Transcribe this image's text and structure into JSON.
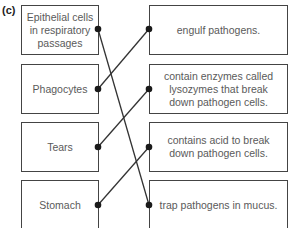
{
  "question_label": "(c)",
  "left_items": [
    {
      "text": "Epithelial cells in respiratory passages"
    },
    {
      "text": "Phagocytes"
    },
    {
      "text": "Tears"
    },
    {
      "text": "Stomach"
    }
  ],
  "right_items": [
    {
      "text": "engulf pathogens."
    },
    {
      "text": "contain enzymes called lysozymes that break down pathogen cells."
    },
    {
      "text": "contains acid to break down pathogen cells."
    },
    {
      "text": "trap pathogens in mucus."
    }
  ],
  "connections": [
    {
      "from": "Epithelial cells in respiratory passages",
      "to": "trap pathogens in mucus."
    },
    {
      "from": "Phagocytes",
      "to": "engulf pathogens."
    },
    {
      "from": "Tears",
      "to": "contain enzymes called lysozymes that break down pathogen cells."
    },
    {
      "from": "Stomach",
      "to": "contains acid to break down pathogen cells."
    }
  ],
  "colors": {
    "border": "#444444",
    "text": "#5a5a5a",
    "line": "#333333"
  }
}
